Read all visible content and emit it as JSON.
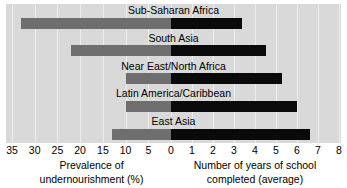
{
  "chart_data": {
    "type": "bar",
    "title": "",
    "orientation": "horizontal",
    "layout": "diverging-bidirectional",
    "grid": true,
    "legend_position": "none",
    "categories": [
      "Sub-Saharan Africa",
      "South Asia",
      "Near East/North Africa",
      "Latin America/Caribbean",
      "East Asia"
    ],
    "series": [
      {
        "name": "Prevalence of undernourishment (%)",
        "direction": "left",
        "color": "#6e6e6e",
        "axis_label_line1": "Prevalence of",
        "axis_label_line2": "undernourishment (%)",
        "ticks": [
          35,
          30,
          25,
          20,
          15,
          10,
          5,
          0
        ],
        "axis_min": 0,
        "axis_max": 35,
        "values": [
          33,
          22,
          10,
          10,
          13
        ]
      },
      {
        "name": "Number of years of school completed (average)",
        "direction": "right",
        "color": "#0a0a0a",
        "axis_label_line1": "Number of years of school",
        "axis_label_line2": "completed (average)",
        "ticks": [
          0,
          1,
          2,
          3,
          4,
          5,
          6,
          7,
          8
        ],
        "axis_min": 0,
        "axis_max": 8,
        "values": [
          3.4,
          4.5,
          5.3,
          6.0,
          6.6
        ]
      }
    ],
    "xlabel": "",
    "ylabel": ""
  },
  "axis": {
    "left_ticks": [
      "35",
      "30",
      "25",
      "20",
      "15",
      "10",
      "5"
    ],
    "center_tick": "0",
    "right_ticks": [
      "1",
      "2",
      "3",
      "4",
      "5",
      "6",
      "7",
      "8"
    ]
  },
  "captions": {
    "left_line1": "Prevalence of",
    "left_line2": "undernourishment (%)",
    "right_line1": "Number of years of school",
    "right_line2": "completed (average)"
  },
  "title_sliver": ""
}
